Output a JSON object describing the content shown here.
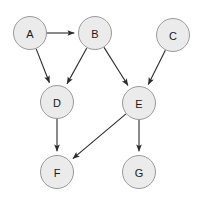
{
  "diagram": {
    "type": "directed-graph",
    "canvas": {
      "width": 200,
      "height": 200,
      "background": "#ffffff"
    },
    "style": {
      "node_fill": "#ebebeb",
      "node_stroke": "#9a9a9a",
      "node_radius": 16.5,
      "label_color": "#1a1a1a",
      "edge_color": "#2b2b2b"
    },
    "nodes": [
      {
        "id": "A",
        "label": "A",
        "cx": 30,
        "cy": 33,
        "r": 16.5
      },
      {
        "id": "B",
        "label": "B",
        "cx": 95,
        "cy": 33,
        "r": 16.5
      },
      {
        "id": "C",
        "label": "C",
        "cx": 173,
        "cy": 35,
        "r": 16.5
      },
      {
        "id": "D",
        "label": "D",
        "cx": 57,
        "cy": 102,
        "r": 16.5
      },
      {
        "id": "E",
        "label": "E",
        "cx": 139,
        "cy": 103,
        "r": 16.5
      },
      {
        "id": "F",
        "label": "F",
        "cx": 57,
        "cy": 172,
        "r": 16.5
      },
      {
        "id": "G",
        "label": "G",
        "cx": 139,
        "cy": 172,
        "r": 16.5
      }
    ],
    "edges": [
      {
        "from": "A",
        "to": "B",
        "directed": true
      },
      {
        "from": "A",
        "to": "D",
        "directed": true
      },
      {
        "from": "B",
        "to": "D",
        "directed": true
      },
      {
        "from": "B",
        "to": "E",
        "directed": true
      },
      {
        "from": "C",
        "to": "E",
        "directed": true
      },
      {
        "from": "D",
        "to": "F",
        "directed": true
      },
      {
        "from": "E",
        "to": "F",
        "directed": true
      },
      {
        "from": "E",
        "to": "G",
        "directed": true
      }
    ]
  }
}
